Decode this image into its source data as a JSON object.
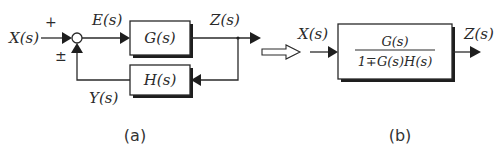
{
  "diagram_a": {
    "caption": "(a)",
    "input_label": "X(s)",
    "plus_sign": "+",
    "feedback_sign": "±",
    "error_label": "E(s)",
    "forward_block": "G(s)",
    "output_label": "Z(s)",
    "feedback_block": "H(s)",
    "feedback_signal_label": "Y(s)"
  },
  "diagram_b": {
    "caption": "(b)",
    "input_label": "X(s)",
    "output_label": "Z(s)",
    "numerator": "G(s)",
    "denominator": "1∓G(s)H(s)"
  },
  "colors": {
    "ink": "#2a2a2a",
    "background": "#ffffff"
  }
}
